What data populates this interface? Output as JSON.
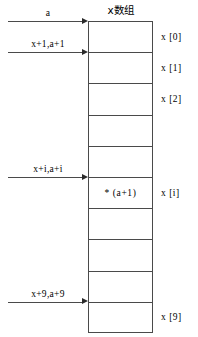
{
  "diagram": {
    "title": "x数组",
    "array": {
      "cells": [
        {
          "index": "x [0]",
          "content": ""
        },
        {
          "index": "x [1]",
          "content": ""
        },
        {
          "index": "x [2]",
          "content": ""
        },
        {
          "index": "",
          "content": ""
        },
        {
          "index": "",
          "content": ""
        },
        {
          "index": "x [i]",
          "content": "* (a+1)"
        },
        {
          "index": "",
          "content": ""
        },
        {
          "index": "",
          "content": ""
        },
        {
          "index": "",
          "content": ""
        },
        {
          "index": "x [9]",
          "content": ""
        }
      ]
    },
    "pointers": [
      {
        "label": "a",
        "target_cell": 0
      },
      {
        "label": "x+1,a+1",
        "target_cell": 1
      },
      {
        "label": "x+i,a+i",
        "target_cell": 5
      },
      {
        "label": "x+9,a+9",
        "target_cell": 9
      }
    ],
    "colors": {
      "line": "#4a4a4a",
      "arrow_head": "#2b2b2b",
      "text": "#000000",
      "background": "#ffffff"
    }
  }
}
